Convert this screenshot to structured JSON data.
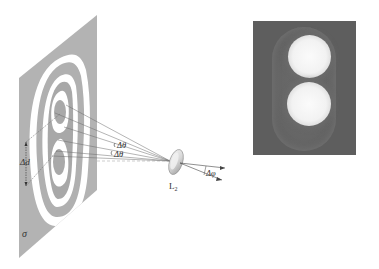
{
  "figure": {
    "screen_label": "σ",
    "screen_separation_label": "Δd",
    "angle_labels": [
      "Δθ",
      "Δθ"
    ],
    "lens_label": "L",
    "lens_subscript": "2",
    "output_angle_label": "Δφ",
    "colors": {
      "screen": "#b3b3b3",
      "fringe_light": "#ffffff",
      "fringe_dark": "#a8a8a8",
      "photo_background": "#5e5e5e",
      "spot": "#f5f5f5",
      "lines": "#666666"
    }
  }
}
